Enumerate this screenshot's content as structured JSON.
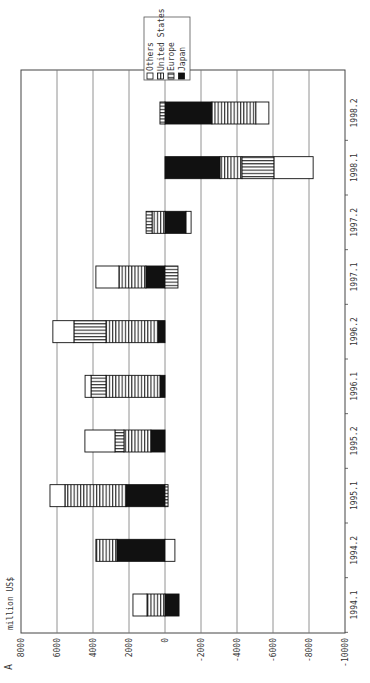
{
  "chart_data": {
    "type": "bar",
    "stacked": true,
    "orientation": "rotated-90-ccw",
    "title": "",
    "panel_label": "A",
    "ylabel": "million US$",
    "xlabel": "",
    "ylim": [
      -10000,
      8000
    ],
    "yticks": [
      8000,
      6000,
      4000,
      2000,
      0,
      -2000,
      -4000,
      -6000,
      -8000,
      -10000
    ],
    "grid": true,
    "legend_position": "top-right (rotated)",
    "categories": [
      "1994.1",
      "1994.2",
      "1995.1",
      "1995.2",
      "1996.1",
      "1996.2",
      "1997.1",
      "1997.2",
      "1998.1",
      "1998.2"
    ],
    "series": [
      {
        "name": "Japan",
        "pattern": "solid-black",
        "values": [
          -780,
          2670,
          2170,
          780,
          280,
          390,
          1060,
          -1170,
          -3060,
          -2610
        ]
      },
      {
        "name": "United States",
        "pattern": "vertical-lines",
        "values": [
          1000,
          1170,
          3390,
          1500,
          3000,
          2890,
          1500,
          720,
          -1220,
          -2440
        ]
      },
      {
        "name": "Europe",
        "pattern": "horizontal-lines",
        "values": [
          0,
          0,
          -170,
          500,
          830,
          1780,
          -720,
          330,
          -1780,
          280
        ]
      },
      {
        "name": "Others",
        "pattern": "white",
        "values": [
          780,
          -550,
          830,
          1670,
          330,
          1170,
          1280,
          -280,
          -2170,
          -720
        ]
      }
    ],
    "legend": [
      "Others",
      "United States",
      "Europe",
      "Japan"
    ]
  },
  "labels": {
    "panel": "A",
    "unit": "million US$"
  }
}
